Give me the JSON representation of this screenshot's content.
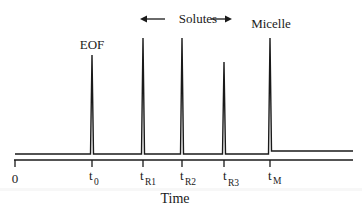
{
  "diagram": {
    "annotations": {
      "eof": "EOF",
      "solutes": "Solutes",
      "micelle": "Micelle"
    },
    "axis": {
      "title": "Time",
      "ticks": [
        {
          "id": "zero",
          "main": "0",
          "sub": ""
        },
        {
          "id": "t0",
          "main": "t",
          "sub": "0"
        },
        {
          "id": "tR1",
          "main": "t",
          "sub": "R1"
        },
        {
          "id": "tR2",
          "main": "t",
          "sub": "R2"
        },
        {
          "id": "tR3",
          "main": "t",
          "sub": "R3"
        },
        {
          "id": "tM",
          "main": "t",
          "sub": "M"
        }
      ]
    },
    "peaks": [
      {
        "label": "EOF",
        "position": "t0",
        "relative_height": 0.8
      },
      {
        "label": "Solute 1",
        "position": "tR1",
        "relative_height": 1.0
      },
      {
        "label": "Solute 2",
        "position": "tR2",
        "relative_height": 1.0
      },
      {
        "label": "Solute 3",
        "position": "tR3",
        "relative_height": 0.76
      },
      {
        "label": "Micelle",
        "position": "tM",
        "relative_height": 1.0
      }
    ],
    "colors": {
      "line": "#1a1a1a",
      "background": "#ffffff"
    }
  }
}
